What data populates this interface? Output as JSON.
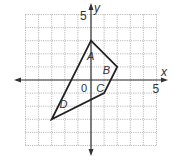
{
  "diagram": {
    "type": "coordinate-plane-polygon",
    "axes": {
      "x_label": "x",
      "y_label": "y",
      "origin_label": "0",
      "x_tick_label": "5",
      "y_tick_label": "5",
      "x_range": [
        -5,
        5
      ],
      "y_range": [
        -5,
        5
      ]
    },
    "polygon": {
      "vertices": [
        [
          0,
          3
        ],
        [
          2,
          1
        ],
        [
          1,
          -1
        ],
        [
          -3,
          -3
        ]
      ]
    },
    "regions": [
      {
        "label": "A",
        "pos": [
          0,
          1.8
        ]
      },
      {
        "label": "B",
        "pos": [
          1.2,
          0.8
        ]
      },
      {
        "label": "C",
        "pos": [
          0.7,
          -0.6
        ]
      },
      {
        "label": "D",
        "pos": [
          -2.1,
          -1.8
        ]
      }
    ],
    "colors": {
      "grid": "#9a9a9a",
      "axis": "#333333",
      "polygon": "#222222",
      "text": "#333333"
    }
  }
}
